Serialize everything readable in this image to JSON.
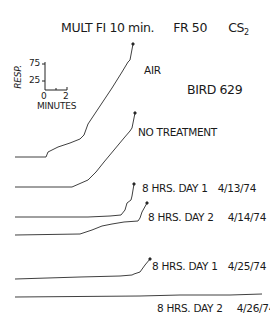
{
  "chart_data": {
    "type": "line",
    "title": "MULT FI 10 min.   FR 50   CS2",
    "title_parts": {
      "schedule": "MULT FI 10 min.",
      "ratio": "FR 50",
      "stimulus": "CS",
      "stimulus_sub": "2"
    },
    "subject": "BIRD 629",
    "scale_bar": {
      "ylabel": "RESP.",
      "yticks": [
        "75",
        "25"
      ],
      "xticks": [
        "0",
        "2"
      ],
      "xlabel": "MINUTES"
    },
    "grid": false,
    "series": [
      {
        "name": "AIR",
        "label": "AIR",
        "date": "",
        "points": [
          [
            15,
            157
          ],
          [
            46,
            157
          ],
          [
            48,
            152
          ],
          [
            58,
            147
          ],
          [
            70,
            143
          ],
          [
            80,
            139
          ],
          [
            84,
            135
          ],
          [
            88,
            124
          ],
          [
            100,
            106
          ],
          [
            112,
            88
          ],
          [
            122,
            72
          ],
          [
            128,
            62
          ],
          [
            130,
            60
          ],
          [
            133,
            44
          ]
        ]
      },
      {
        "name": "NO TREATMENT",
        "label": "NO TREATMENT",
        "date": "",
        "points": [
          [
            15,
            187
          ],
          [
            72,
            187
          ],
          [
            88,
            180
          ],
          [
            96,
            172
          ],
          [
            104,
            162
          ],
          [
            114,
            150
          ],
          [
            124,
            138
          ],
          [
            130,
            131
          ],
          [
            132,
            128
          ],
          [
            135,
            113
          ]
        ]
      },
      {
        "name": "8 HRS. DAY 1",
        "label": "8 HRS. DAY 1",
        "date": "4/13/74",
        "points": [
          [
            15,
            217
          ],
          [
            88,
            217
          ],
          [
            110,
            216
          ],
          [
            121,
            215
          ],
          [
            125,
            210
          ],
          [
            127,
            203
          ],
          [
            131,
            200
          ],
          [
            132,
            196
          ],
          [
            134,
            184
          ]
        ]
      },
      {
        "name": "8 HRS. DAY 2",
        "label": "8 HRS. DAY 2",
        "date": "4/14/74",
        "points": [
          [
            15,
            235
          ],
          [
            80,
            234
          ],
          [
            92,
            230
          ],
          [
            102,
            226
          ],
          [
            112,
            224
          ],
          [
            124,
            222
          ],
          [
            138,
            221
          ],
          [
            140,
            218
          ],
          [
            142,
            212
          ],
          [
            147,
            203
          ]
        ]
      },
      {
        "name": "8 HRS. DAY 1",
        "label": "8 HRS. DAY 1",
        "date": "4/25/74",
        "points": [
          [
            15,
            279
          ],
          [
            80,
            277
          ],
          [
            120,
            276
          ],
          [
            132,
            275
          ],
          [
            134,
            274
          ],
          [
            140,
            272
          ],
          [
            145,
            265
          ],
          [
            150,
            259
          ]
        ]
      },
      {
        "name": "8 HRS. DAY 2",
        "label": "8 HRS. DAY 2",
        "date": "4/26/74",
        "points": [
          [
            15,
            297
          ],
          [
            140,
            296
          ],
          [
            180,
            295
          ],
          [
            230,
            295
          ],
          [
            262,
            294
          ]
        ]
      }
    ]
  },
  "labels": {
    "title_schedule": "MULT FI 10 min.",
    "title_ratio": "FR 50",
    "title_cs": "CS",
    "title_cs_sub": "2",
    "subject": "BIRD 629",
    "ylabel": "RESP.",
    "ytick_75": "75",
    "ytick_25": "25",
    "xtick_0": "0",
    "xtick_2": "2",
    "xlabel": "MINUTES",
    "air": "AIR",
    "no_treatment": "NO TREATMENT",
    "r3": "8 HRS. DAY 1",
    "r3_date": "4/13/74",
    "r4": "8 HRS. DAY 2",
    "r4_date": "4/14/74",
    "r5": "8 HRS. DAY 1",
    "r5_date": "4/25/74",
    "r6": "8 HRS. DAY 2",
    "r6_date": "4/26/74"
  }
}
